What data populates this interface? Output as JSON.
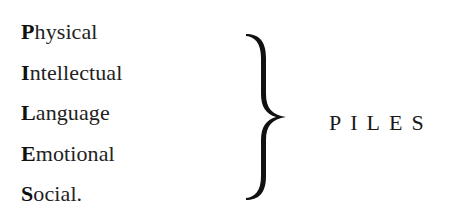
{
  "items": [
    {
      "initial": "P",
      "rest": "hysical"
    },
    {
      "initial": "I",
      "rest": "ntellectual"
    },
    {
      "initial": "L",
      "rest": "anguage"
    },
    {
      "initial": "E",
      "rest": "motional"
    },
    {
      "initial": "S",
      "rest": "ocial."
    }
  ],
  "brace_icon": "right-curly-brace",
  "acronym": "PILES",
  "colors": {
    "text": "#1a1a1a",
    "background": "#ffffff"
  }
}
